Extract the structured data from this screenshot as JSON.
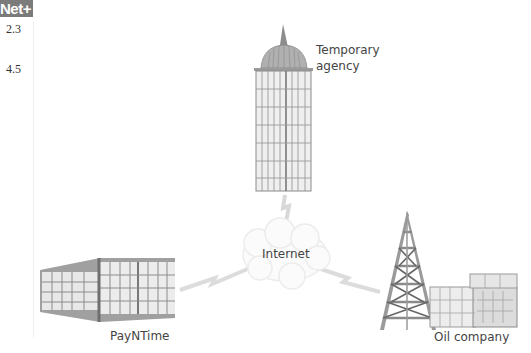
{
  "badge": {
    "text": "Net+"
  },
  "objectives": [
    "2.3",
    "4.5"
  ],
  "nodes": {
    "temporary_agency": {
      "label_line1": "Temporary",
      "label_line2": "agency"
    },
    "internet": {
      "label": "Internet"
    },
    "payntime": {
      "label": "PayNTime"
    },
    "oil_company": {
      "label": "Oil company"
    }
  },
  "colors": {
    "building": "#9a9a9a",
    "glass": "#e4e4e4",
    "link": "#d6d6d6",
    "badge": "#7b7b7b"
  }
}
